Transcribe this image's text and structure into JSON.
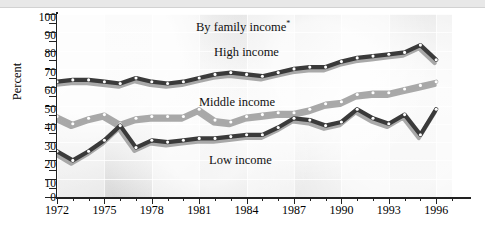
{
  "chart_data": {
    "type": "line",
    "title": "By family income",
    "title_footnote_marker": "*",
    "xlabel": "",
    "ylabel": "Percent",
    "xlim": [
      1972,
      1997
    ],
    "ylim": [
      0,
      100
    ],
    "ytick_step": 10,
    "yticks": [
      0,
      10,
      20,
      30,
      40,
      50,
      60,
      70,
      80,
      90,
      100
    ],
    "xticks_labeled": [
      1972,
      1975,
      1978,
      1981,
      1984,
      1987,
      1990,
      1993,
      1996
    ],
    "x": [
      1972,
      1973,
      1974,
      1975,
      1976,
      1977,
      1978,
      1979,
      1980,
      1981,
      1982,
      1983,
      1984,
      1985,
      1986,
      1987,
      1988,
      1989,
      1990,
      1991,
      1992,
      1993,
      1994,
      1995,
      1996
    ],
    "grid": true,
    "legend_position": "inline-labels",
    "series": [
      {
        "name": "High income",
        "color": "#3a3a3a",
        "values": [
          63,
          64,
          64,
          63,
          62,
          65,
          63,
          62,
          63,
          65,
          67,
          68,
          67,
          66,
          68,
          70,
          71,
          71,
          74,
          76,
          77,
          78,
          79,
          83,
          75
        ]
      },
      {
        "name": "Middle income",
        "color": "#a8a8a8",
        "values": [
          44,
          40,
          43,
          45,
          40,
          43,
          44,
          44,
          44,
          48,
          42,
          41,
          44,
          45,
          46,
          46,
          48,
          51,
          52,
          56,
          57,
          57,
          59,
          61,
          63
        ]
      },
      {
        "name": "Low income",
        "color": "#3a3a3a",
        "values": [
          25,
          20,
          25,
          31,
          39,
          27,
          31,
          30,
          31,
          32,
          32,
          33,
          34,
          34,
          38,
          43,
          42,
          39,
          41,
          48,
          43,
          40,
          45,
          34,
          48
        ]
      }
    ],
    "annotations": [
      {
        "text": "By family income*",
        "role": "chart-title"
      },
      {
        "text": "High income",
        "role": "series-label"
      },
      {
        "text": "Middle income",
        "role": "series-label"
      },
      {
        "text": "Low income",
        "role": "series-label"
      }
    ]
  },
  "axes": {
    "y_title": "Percent",
    "y_labels": [
      "100",
      "90",
      "80",
      "70",
      "60",
      "50",
      "40",
      "30",
      "20",
      "10",
      "0"
    ],
    "x_labels": [
      "1972",
      "1975",
      "1978",
      "1981",
      "1984",
      "1987",
      "1990",
      "1993",
      "1996"
    ]
  },
  "labels": {
    "title": "By family income",
    "title_marker": "*",
    "high": "High income",
    "middle": "Middle income",
    "low": "Low income"
  },
  "colors": {
    "dark_series": "#3a3a3a",
    "light_series": "#a8a8a8",
    "shadow": "#9a9a9a",
    "marker_fill": "#ffffff",
    "plot_background": "#ececec",
    "axis": "#222222"
  }
}
